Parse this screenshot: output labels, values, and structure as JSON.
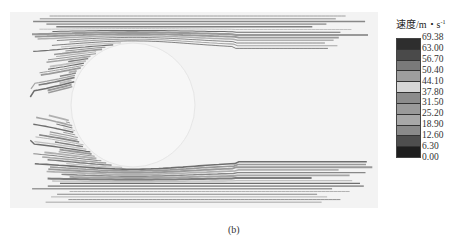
{
  "figure": {
    "caption": "(b)",
    "obstacle": {
      "shape": "circle",
      "cx": 123,
      "cy": 93,
      "r": 62,
      "fill": "#f7f7f7"
    },
    "plot_area": {
      "x": 10,
      "y": 12,
      "width": 368,
      "height": 196,
      "background": "#f3f3f3"
    }
  },
  "legend": {
    "title": "速度/m・s",
    "title_superscript": "-1",
    "labels": [
      "69.38",
      "63.00",
      "56.70",
      "50.40",
      "44.10",
      "37.80",
      "31.50",
      "25.20",
      "18.90",
      "12.60",
      "6.30",
      "0.00"
    ],
    "band_colors": [
      "#2e2e2e",
      "#4a4a4a",
      "#7a7a7a",
      "#9e9e9e",
      "#d6d6d6",
      "#8c8c8c",
      "#9a9a9a",
      "#a8a8a8",
      "#8a8a8a",
      "#4e4e4e",
      "#1e1e1e"
    ]
  }
}
